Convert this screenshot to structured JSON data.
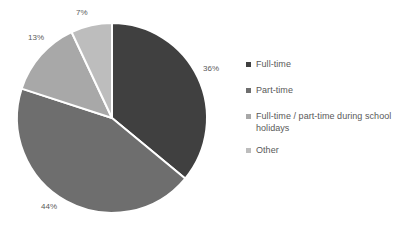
{
  "chart_data": {
    "type": "pie",
    "title": "",
    "subtitle": "",
    "xlabel": "",
    "ylabel": "",
    "categories": [
      "Full-time",
      "Part-time",
      "Full-time / part-time during school holidays",
      "Other"
    ],
    "values": [
      36,
      44,
      13,
      7
    ],
    "value_labels": [
      "36%",
      "44%",
      "13%",
      "7%"
    ],
    "colors": [
      "#404040",
      "#6e6e6e",
      "#a8a8a8",
      "#bdbdbd"
    ],
    "units": "percent",
    "start_angle_deg": 0,
    "direction": "clockwise",
    "grid": false,
    "legend_position": "right",
    "background": "#ffffff",
    "separator_color": "#ffffff",
    "label_color": "#5a5a5a",
    "slices": [
      {
        "label": "Full-time",
        "value": 36,
        "display": "36%",
        "color": "#404040"
      },
      {
        "label": "Part-time",
        "value": 44,
        "display": "44%",
        "color": "#6e6e6e"
      },
      {
        "label": "Full-time / part-time during school holidays",
        "value": 13,
        "display": "13%",
        "color": "#a8a8a8"
      },
      {
        "label": "Other",
        "value": 7,
        "display": "7%",
        "color": "#bdbdbd"
      }
    ]
  },
  "legend": {
    "items": [
      {
        "label": "Full-time",
        "color": "#404040"
      },
      {
        "label": "Part-time",
        "color": "#6e6e6e"
      },
      {
        "label": "Full-time / part-time during school holidays",
        "color": "#a8a8a8"
      },
      {
        "label": "Other",
        "color": "#bdbdbd"
      }
    ]
  }
}
